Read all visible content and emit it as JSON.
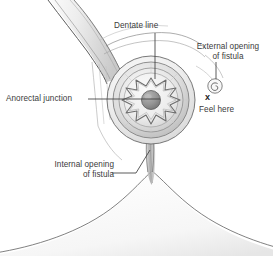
{
  "figure": {
    "view": "perineal view of anus showing fistula tract",
    "background_color": "#ffffff",
    "text_color": "#3b3b3b",
    "line_color": "#4a4a4a"
  },
  "labels": {
    "dentate_line": "Dentate line",
    "anorectal_junction": "Anorectal junction",
    "external_opening_line1": "External opening",
    "external_opening_line2": "of fistula",
    "feel_here": "Feel here",
    "internal_opening_line1": "Internal opening",
    "internal_opening_line2": "of fistula",
    "x_marker": "x"
  },
  "structures": {
    "rectum_tube": "rectum-tube",
    "anal_canal": "anal-canal-opening",
    "dentate_ring": "dentate-line-ring",
    "sphincter_rings": "sphincter-concentric-rings",
    "external_fistula_opening": "external-fistula-opening-spiral",
    "buttocks": "buttocks-natal-cleft",
    "fistula_tract": "fistula-tract"
  },
  "colors": {
    "tissue_light": "#f2f2f2",
    "tissue_mid": "#d8d8d8",
    "tissue_dark": "#b0b0b0",
    "opening_fill": "#8f8f8f",
    "outline": "#555555"
  }
}
